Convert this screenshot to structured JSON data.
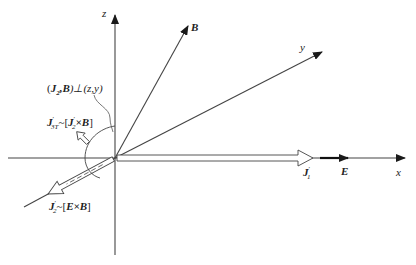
{
  "diagram": {
    "axes": {
      "z": "z",
      "y": "y",
      "x": "x"
    },
    "vectors": {
      "B": "B",
      "E": "E",
      "J1": "J",
      "J1_sup": "′",
      "J1_sub": "1"
    },
    "annotations": {
      "perp": {
        "open": "(",
        "J2": "J",
        "J2_sub": "2",
        "comma_B": ",B",
        "close_perp": ")⊥(z,y)"
      },
      "j3t": {
        "J": "J",
        "sup": "′",
        "sub": "3T",
        "rest": "~[",
        "J2": "J",
        "J2_sup": "′",
        "J2_sub": "2",
        "xB": "×B",
        "close": "]"
      },
      "j2": {
        "J": "J",
        "sup": "′",
        "sub": "2",
        "rest": "~[",
        "ExB": "E×B",
        "close": "]"
      }
    },
    "colors": {
      "line": "#333333",
      "arrow": "#1a1a1a",
      "background": "#ffffff"
    }
  }
}
